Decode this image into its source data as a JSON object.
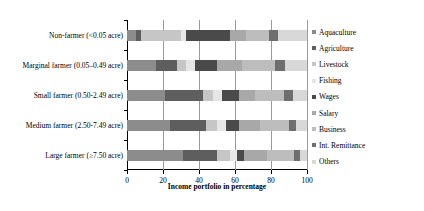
{
  "chart_data": {
    "type": "bar",
    "orientation": "horizontal",
    "stacked": true,
    "normalized_percent": true,
    "title": "",
    "xlabel": "Income portfolio in percentage",
    "ylabel": "",
    "xlim": [
      0,
      100
    ],
    "xticks": [
      0,
      20,
      40,
      60,
      80,
      100
    ],
    "grid": true,
    "grid_axis": "x",
    "legend_position": "right",
    "categories": [
      "Non-farmer (<0.05 acre)",
      "Marginal farmer (0.05–0.49 acre)",
      "Small farmer (0.50-2.49 acre)",
      "Medium farmer (2.50-7.49 acre)",
      "Large farmer (≥7.50 acre)"
    ],
    "series": [
      {
        "name": "Aquaculture",
        "color": "#8c8c8c",
        "values": [
          5,
          16,
          21,
          24,
          31
        ]
      },
      {
        "name": "Agriculture",
        "color": "#5e5e5e",
        "values": [
          3,
          12,
          21,
          20,
          19
        ]
      },
      {
        "name": "Livestock",
        "color": "#c6c6c6",
        "values": [
          22,
          5,
          6,
          6,
          7
        ]
      },
      {
        "name": "Fishing",
        "color": "#e6e6e6",
        "values": [
          3,
          5,
          5,
          5,
          4
        ]
      },
      {
        "name": "Wages",
        "color": "#4a4a4a",
        "values": [
          24,
          12,
          9,
          7,
          4
        ]
      },
      {
        "name": "Salary",
        "color": "#a8a8a8",
        "values": [
          9,
          14,
          9,
          12,
          13
        ]
      },
      {
        "name": "Business",
        "color": "#bdbdbd",
        "values": [
          13,
          18,
          16,
          16,
          15
        ]
      },
      {
        "name": "Int. Remittance",
        "color": "#6e6e6e",
        "values": [
          5,
          6,
          5,
          4,
          3
        ]
      },
      {
        "name": "Others",
        "color": "#d8d8d8",
        "values": [
          16,
          12,
          8,
          6,
          4
        ]
      }
    ]
  },
  "legend": {
    "items": [
      {
        "label": "Aquaculture"
      },
      {
        "label": "Agriculture"
      },
      {
        "label": "Livestock"
      },
      {
        "label": "Fishing"
      },
      {
        "label": "Wages"
      },
      {
        "label": "Salary"
      },
      {
        "label": "Business"
      },
      {
        "label": "Int. Remittance"
      },
      {
        "label": "Others"
      }
    ]
  }
}
